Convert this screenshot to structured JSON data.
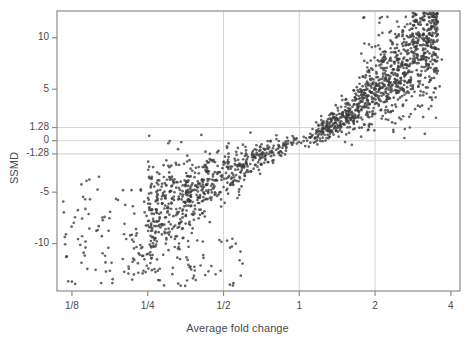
{
  "chart_data": {
    "type": "scatter",
    "title": "",
    "xlabel": "Average fold change",
    "ylabel": "SSMD",
    "grid": true,
    "legend": null,
    "x_scale": "log2",
    "xlim": [
      0.109,
      4.35
    ],
    "ylim": [
      -14.6,
      12.6
    ],
    "xticks": [
      {
        "label": "1/8",
        "value": 0.125
      },
      {
        "label": "1/4",
        "value": 0.25
      },
      {
        "label": "1/2",
        "value": 0.5
      },
      {
        "label": "1",
        "value": 1
      },
      {
        "label": "2",
        "value": 2
      },
      {
        "label": "4",
        "value": 4
      }
    ],
    "yticks": [
      {
        "label": "10",
        "value": 10
      },
      {
        "label": "5",
        "value": 5
      },
      {
        "label": "1.28",
        "value": 1.28
      },
      {
        "label": "0",
        "value": 0
      },
      {
        "label": "-1.28",
        "value": -1.28
      },
      {
        "label": "-5",
        "value": -5
      },
      {
        "label": "-10",
        "value": -10
      }
    ],
    "hlines": [
      1.28,
      0,
      -1.28
    ],
    "vlines": [
      0.5,
      1,
      2
    ],
    "colors": {
      "point": "#3b3b3b",
      "gridline": "#d6d6d6",
      "frame": "#8c8c8c",
      "text": "#4a4a4a",
      "background": "#ffffff"
    },
    "point_count": 1800,
    "marker": {
      "shape": "circle",
      "size": 1.35,
      "opacity": 0.78
    },
    "series": [
      {
        "name": "up-regulated-dense",
        "n": 980,
        "x_range": [
          1.0,
          3.6
        ],
        "y_range": [
          0.0,
          12.4
        ],
        "note": "dense dark band rising from origin toward upper right"
      },
      {
        "name": "down-regulated-sparse",
        "n": 760,
        "x_range": [
          0.115,
          1.0
        ],
        "y_range": [
          -14.3,
          0.0
        ],
        "note": "broader more diffuse cloud descending to lower left"
      }
    ]
  },
  "figure": {
    "ylabel": "SSMD",
    "xlabel": "Average fold change"
  }
}
